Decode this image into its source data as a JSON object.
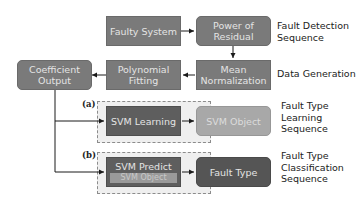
{
  "nodes": {
    "faulty_system": "Faulty System",
    "power_of_residual": [
      "Power of",
      "Residual"
    ],
    "mean_normalization": [
      "Mean",
      "Normalization"
    ],
    "polynomial_fitting": [
      "Polynomial",
      "Fitting"
    ],
    "coefficient_output": [
      "Coefficient",
      "Output"
    ],
    "svm_learning": "SVM Learning",
    "svm_object": "SVM Object",
    "svm_predict": "SVM Predict",
    "svm_predict_sub": "SVM Object",
    "fault_type": "Fault Type"
  },
  "labels": {
    "fault_detection": [
      "Fault Detection",
      "Sequence"
    ],
    "data_generation": "Data Generation",
    "fault_type_learning": [
      "Fault Type",
      "Learning",
      "Sequence"
    ],
    "fault_type_classification": [
      "Fault Type",
      "Classification",
      "Sequence"
    ]
  },
  "tags": {
    "a": "(a)",
    "b": "(b)"
  },
  "colors": {
    "box": "#7a7a7a",
    "box_dark": "#5e5e5e",
    "box_light": "#a8a8a8",
    "sequence_bg": "#efefef",
    "dash": "#8c8c8c",
    "arrow": "#1a1a1a"
  }
}
